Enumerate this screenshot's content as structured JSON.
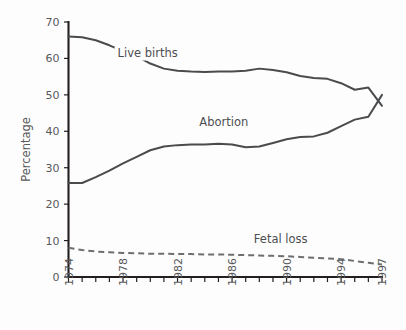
{
  "chart_data": {
    "type": "line",
    "title": "",
    "xlabel": "",
    "ylabel": "Percentage",
    "xlim": [
      1974,
      1997
    ],
    "ylim": [
      0,
      70
    ],
    "grid": false,
    "legend_position": "inline-labels",
    "x": [
      1974,
      1975,
      1976,
      1977,
      1978,
      1979,
      1980,
      1981,
      1982,
      1983,
      1984,
      1985,
      1986,
      1987,
      1988,
      1989,
      1990,
      1991,
      1992,
      1993,
      1994,
      1995,
      1996,
      1997
    ],
    "y_ticks": [
      0,
      10,
      20,
      30,
      40,
      50,
      60,
      70
    ],
    "x_ticks_labeled": [
      1974,
      1978,
      1982,
      1986,
      1990,
      1994,
      1997
    ],
    "x_tick_labels": [
      "1974",
      "1978",
      "1982",
      "1986",
      "1990",
      "1994",
      "1997"
    ],
    "y_tick_labels": [
      "0",
      "10",
      "20",
      "30",
      "40",
      "50",
      "60",
      "70"
    ],
    "series": [
      {
        "name": "Live births",
        "style": "solid",
        "color": "#4a4b4d",
        "label_x": 1977.6,
        "label_y": 60.5,
        "values": [
          66.0,
          65.8,
          65.0,
          63.6,
          62.0,
          60.6,
          58.6,
          57.2,
          56.6,
          56.4,
          56.3,
          56.4,
          56.4,
          56.6,
          57.2,
          56.8,
          56.2,
          55.2,
          54.6,
          54.4,
          53.2,
          51.4,
          52.0,
          47.0
        ]
      },
      {
        "name": "Abortion",
        "style": "solid",
        "color": "#4a4b4d",
        "label_x": 1983.6,
        "label_y": 41.5,
        "values": [
          25.8,
          25.8,
          27.4,
          29.2,
          31.2,
          33.0,
          34.8,
          35.8,
          36.2,
          36.4,
          36.4,
          36.6,
          36.4,
          35.6,
          35.8,
          36.8,
          37.8,
          38.4,
          38.6,
          39.6,
          41.4,
          43.2,
          44.0,
          50.0
        ]
      },
      {
        "name": "Fetal loss",
        "style": "dashed",
        "color": "#6d6e70",
        "label_x": 1987.6,
        "label_y": 9.2,
        "values": [
          8.0,
          7.4,
          7.0,
          6.8,
          6.6,
          6.5,
          6.4,
          6.4,
          6.3,
          6.3,
          6.2,
          6.2,
          6.1,
          6.0,
          5.9,
          5.8,
          5.7,
          5.5,
          5.3,
          5.1,
          4.9,
          4.4,
          3.9,
          3.4
        ]
      }
    ]
  },
  "colors": {
    "background": "#fdfdfd",
    "axis": "#231f20",
    "text": "#58595b",
    "series_solid": "#4a4b4d",
    "series_dashed": "#6d6e70"
  }
}
